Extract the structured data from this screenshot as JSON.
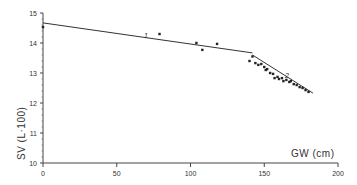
{
  "chart_data": {
    "type": "scatter",
    "title": "",
    "xlabel": "GW (cm)",
    "ylabel": "SV (L·100)",
    "xlim": [
      0,
      200
    ],
    "ylim": [
      10,
      15
    ],
    "x_ticks": [
      0,
      50,
      100,
      150,
      200
    ],
    "y_ticks": [
      10,
      11,
      12,
      13,
      14,
      15
    ],
    "grid": false,
    "legend": null,
    "annotations": [
      {
        "text": "1",
        "x": 69,
        "y": 14.27
      },
      {
        "text": "2",
        "x": 166,
        "y": 12.87
      }
    ],
    "series": [
      {
        "name": "observations",
        "type": "scatter",
        "points": [
          [
            0,
            14.53
          ],
          [
            79,
            14.3
          ],
          [
            104,
            14.0
          ],
          [
            108,
            13.77
          ],
          [
            118,
            13.97
          ],
          [
            140,
            13.4
          ],
          [
            142,
            13.55
          ],
          [
            144,
            13.33
          ],
          [
            146,
            13.27
          ],
          [
            148,
            13.3
          ],
          [
            150,
            13.2
          ],
          [
            151,
            13.1
          ],
          [
            152,
            13.13
          ],
          [
            154,
            13.0
          ],
          [
            156,
            12.97
          ],
          [
            157,
            12.83
          ],
          [
            159,
            12.87
          ],
          [
            160,
            12.8
          ],
          [
            162,
            12.83
          ],
          [
            163,
            12.73
          ],
          [
            165,
            12.77
          ],
          [
            167,
            12.7
          ],
          [
            168,
            12.73
          ],
          [
            170,
            12.63
          ],
          [
            172,
            12.6
          ],
          [
            174,
            12.53
          ],
          [
            176,
            12.5
          ],
          [
            178,
            12.43
          ],
          [
            180,
            12.37
          ]
        ]
      },
      {
        "name": "regression 1",
        "type": "line",
        "points": [
          [
            0,
            14.67
          ],
          [
            142,
            13.67
          ]
        ]
      },
      {
        "name": "regression 2",
        "type": "line",
        "points": [
          [
            142,
            13.6
          ],
          [
            183,
            12.33
          ]
        ]
      }
    ]
  },
  "labels": {
    "xlabel": "GW (cm)",
    "ylabel": "SV (L·100)",
    "x_ticks": [
      "0",
      "50",
      "100",
      "150",
      "200"
    ],
    "y_ticks": [
      "10",
      "11",
      "12",
      "13",
      "14",
      "15"
    ],
    "ann1": "1",
    "ann2": "2"
  }
}
